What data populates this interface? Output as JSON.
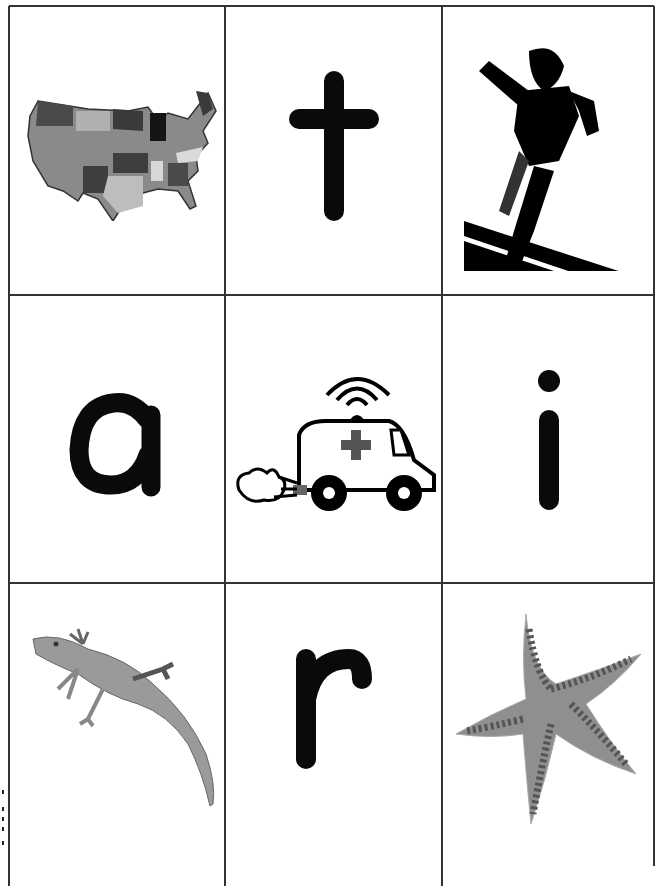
{
  "sheet": {
    "rows": 3,
    "columns": 3,
    "line_color": "#333333",
    "cards": [
      {
        "row": 0,
        "col": 0,
        "type": "picture",
        "subject": "map of the United States"
      },
      {
        "row": 0,
        "col": 1,
        "type": "letter",
        "letter": "t"
      },
      {
        "row": 0,
        "col": 2,
        "type": "picture",
        "subject": "runner"
      },
      {
        "row": 1,
        "col": 0,
        "type": "letter",
        "letter": "a"
      },
      {
        "row": 1,
        "col": 1,
        "type": "picture",
        "subject": "ambulance"
      },
      {
        "row": 1,
        "col": 2,
        "type": "letter",
        "letter": "i"
      },
      {
        "row": 2,
        "col": 0,
        "type": "picture",
        "subject": "lizard"
      },
      {
        "row": 2,
        "col": 1,
        "type": "letter",
        "letter": "r"
      },
      {
        "row": 2,
        "col": 2,
        "type": "picture",
        "subject": "starfish"
      }
    ]
  },
  "colors": {
    "letter": "#0a0a0a",
    "map_dark": "#3a3a3a",
    "map_mid": "#7a7a7a",
    "map_light": "#b8b8b8",
    "cross": "#555555",
    "lizard": "#9a9a9a",
    "starfish": "#8f8f8f",
    "starfish_dots": "#555555"
  }
}
